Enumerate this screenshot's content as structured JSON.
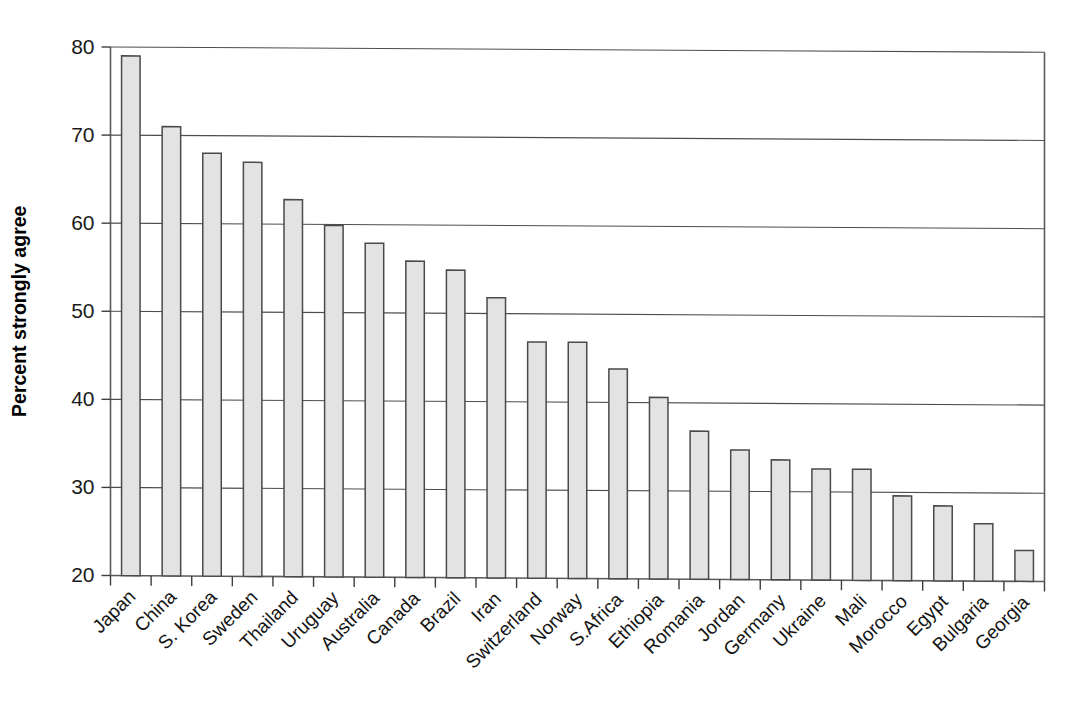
{
  "chart_data": {
    "type": "bar",
    "title": "",
    "xlabel": "",
    "ylabel": "Percent strongly agree",
    "ylim": [
      20,
      80
    ],
    "yticks": [
      20,
      30,
      40,
      50,
      60,
      70,
      80
    ],
    "ytick_labels": [
      "20",
      "30",
      "40",
      "50",
      "60",
      "70",
      "80"
    ],
    "grid": "horizontal",
    "legend": "none",
    "bar_fill": "#e3e3e3",
    "bar_edge": "#4a4a4a",
    "categories": [
      "Japan",
      "China",
      "S. Korea",
      "Sweden",
      "Thailand",
      "Uruguay",
      "Australia",
      "Canada",
      "Brazil",
      "Iran",
      "Switzerland",
      "Norway",
      "S.Africa",
      "Ethiopia",
      "Romania",
      "Jordan",
      "Germany",
      "Ukraine",
      "Mali",
      "Morocco",
      "Egypt",
      "Bulgaria",
      "Georgia"
    ],
    "values": [
      79.0,
      71.0,
      68.0,
      67.0,
      62.8,
      59.9,
      57.9,
      55.9,
      54.9,
      51.8,
      46.8,
      46.8,
      43.8,
      40.6,
      36.8,
      34.7,
      33.6,
      32.6,
      32.6,
      29.6,
      28.5,
      26.5,
      23.5
    ]
  }
}
